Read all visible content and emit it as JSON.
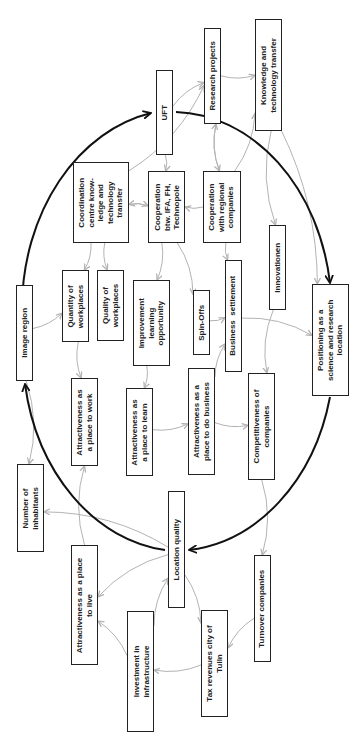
{
  "diagram": {
    "type": "causal-loop-diagram",
    "orientation": "rotated 90 degrees counter-clockwise",
    "colors": {
      "node_border": "#222222",
      "edge": "#b3b3b3",
      "main_loop": "#111111",
      "background": "#ffffff"
    },
    "nodes": [
      {
        "id": "uft",
        "label": "UFT",
        "x": 156,
        "y": 70,
        "w": 17,
        "h": 85
      },
      {
        "id": "research",
        "label": "Research projects",
        "x": 204,
        "y": 28,
        "w": 17,
        "h": 96
      },
      {
        "id": "knowledge",
        "label": "Knowledge and\ntechnology transfer",
        "x": 255,
        "y": 19,
        "w": 27,
        "h": 112
      },
      {
        "id": "coordination",
        "label": "Coordination\ncentre know-\nledge and\ntechnology\ntransfer",
        "x": 73,
        "y": 162,
        "w": 56,
        "h": 81
      },
      {
        "id": "coop_ifa",
        "label": "Cooperation\nbtw. IFA, FH,\nTechnopole",
        "x": 148,
        "y": 171,
        "w": 37,
        "h": 72
      },
      {
        "id": "coop_regional",
        "label": "Cooperation\nwith regional\ncompanies",
        "x": 203,
        "y": 171,
        "w": 38,
        "h": 72
      },
      {
        "id": "innovationen",
        "label": "Innovationen",
        "x": 269,
        "y": 225,
        "w": 17,
        "h": 85
      },
      {
        "id": "image_region",
        "label": "Image region",
        "x": 16,
        "y": 285,
        "w": 17,
        "h": 96
      },
      {
        "id": "quantity",
        "label": "Quantity of\nworkplaces",
        "x": 62,
        "y": 270,
        "w": 27,
        "h": 72
      },
      {
        "id": "quality",
        "label": "Quality of\nworkplaces",
        "x": 97,
        "y": 270,
        "w": 27,
        "h": 71
      },
      {
        "id": "improvement",
        "label": "Improvement\nlearning\nopportunity",
        "x": 133,
        "y": 280,
        "w": 37,
        "h": 86
      },
      {
        "id": "spinoffs",
        "label": "Spin-Offs",
        "x": 193,
        "y": 290,
        "w": 17,
        "h": 65
      },
      {
        "id": "business",
        "label": "Business  settlement",
        "x": 225,
        "y": 260,
        "w": 17,
        "h": 112
      },
      {
        "id": "positioning",
        "label": "Positioning as a\nscience and research\nlocation",
        "x": 312,
        "y": 284,
        "w": 37,
        "h": 112
      },
      {
        "id": "attr_work",
        "label": "Attractiveness as\na place to work",
        "x": 71,
        "y": 378,
        "w": 27,
        "h": 88
      },
      {
        "id": "attr_learn",
        "label": "Attractiveness as\na place to learn",
        "x": 126,
        "y": 388,
        "w": 27,
        "h": 88
      },
      {
        "id": "attr_business",
        "label": "Attractiveness as a\nplace to do business",
        "x": 188,
        "y": 368,
        "w": 27,
        "h": 107
      },
      {
        "id": "competitiveness",
        "label": "Competitiveness of\ncompanies",
        "x": 248,
        "y": 373,
        "w": 27,
        "h": 107
      },
      {
        "id": "inhabitants",
        "label": "Number of\ninhabitants",
        "x": 17,
        "y": 464,
        "w": 27,
        "h": 88
      },
      {
        "id": "location",
        "label": "Location quality",
        "x": 168,
        "y": 491,
        "w": 17,
        "h": 117
      },
      {
        "id": "attr_live",
        "label": "Attractiveness as a place\nto live",
        "x": 71,
        "y": 545,
        "w": 27,
        "h": 120
      },
      {
        "id": "investment",
        "label": "Investment in\ninfrastructure",
        "x": 127,
        "y": 611,
        "w": 27,
        "h": 121
      },
      {
        "id": "tax",
        "label": "Tax revenues city of\nTulln",
        "x": 201,
        "y": 610,
        "w": 27,
        "h": 107
      },
      {
        "id": "turnover",
        "label": "Turnover companies",
        "x": 254,
        "y": 555,
        "w": 17,
        "h": 107
      }
    ],
    "main_loop": {
      "shape": "ellipse",
      "cx": 182,
      "cy": 316,
      "rx": 160,
      "ry": 200,
      "arrowheads": [
        "uft",
        "positioning",
        "location",
        "image_region"
      ]
    },
    "edges": [
      {
        "from": "uft",
        "to": "research"
      },
      {
        "from": "research",
        "to": "knowledge"
      },
      {
        "from": "uft",
        "to": "coop_ifa"
      },
      {
        "from": "research",
        "to": "coop_regional"
      },
      {
        "from": "coop_regional",
        "to": "research"
      },
      {
        "from": "coordination",
        "to": "research"
      },
      {
        "from": "coop_regional",
        "to": "coop_ifa"
      },
      {
        "from": "coop_ifa",
        "to": "coordination"
      },
      {
        "from": "coordination",
        "to": "coop_ifa"
      },
      {
        "from": "knowledge",
        "to": "innovationen"
      },
      {
        "from": "knowledge",
        "to": "positioning"
      },
      {
        "from": "coop_regional",
        "to": "knowledge"
      },
      {
        "from": "coop_ifa",
        "to": "spinoffs"
      },
      {
        "from": "coop_regional",
        "to": "business"
      },
      {
        "from": "coordination",
        "to": "quantity"
      },
      {
        "from": "coordination",
        "to": "quality"
      },
      {
        "from": "coop_ifa",
        "to": "improvement"
      },
      {
        "from": "spinoffs",
        "to": "business"
      },
      {
        "from": "business",
        "to": "positioning"
      },
      {
        "from": "innovationen",
        "to": "competitiveness"
      },
      {
        "from": "image_region",
        "to": "inhabitants"
      },
      {
        "from": "quantity",
        "to": "attr_work"
      },
      {
        "from": "improvement",
        "to": "attr_learn"
      },
      {
        "from": "attr_learn",
        "to": "attr_business"
      },
      {
        "from": "attr_business",
        "to": "business"
      },
      {
        "from": "attr_business",
        "to": "competitiveness"
      },
      {
        "from": "competitiveness",
        "to": "turnover"
      },
      {
        "from": "location",
        "to": "inhabitants"
      },
      {
        "from": "location",
        "to": "tax"
      },
      {
        "from": "location",
        "to": "attr_live"
      },
      {
        "from": "attr_live",
        "to": "attr_work"
      },
      {
        "from": "turnover",
        "to": "tax"
      },
      {
        "from": "tax",
        "to": "investment"
      },
      {
        "from": "investment",
        "to": "attr_live"
      },
      {
        "from": "investment",
        "to": "location"
      },
      {
        "from": "image_region",
        "to": "quantity"
      }
    ]
  }
}
